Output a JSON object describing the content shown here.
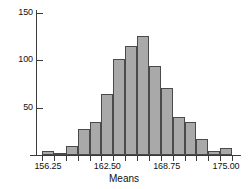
{
  "chart_data": {
    "type": "bar",
    "title": "",
    "subtitle": "",
    "xlabel": "Means",
    "ylabel": "",
    "grid": false,
    "legend": null,
    "bin_width": 1.25,
    "bin_start": 155.625,
    "xlim": [
      155.625,
      175.625
    ],
    "ylim": [
      0,
      160
    ],
    "y_ticks": [
      50,
      100,
      150
    ],
    "y_tick_labels": [
      "50",
      "100",
      "150"
    ],
    "x_ticks": [
      156.25,
      162.5,
      168.75,
      175.0
    ],
    "x_tick_labels": [
      "156.25",
      "162.50",
      "168.75",
      "175.00"
    ],
    "x_minor_tick_count": 17,
    "categories": [
      "155.625-156.875",
      "156.875-158.125",
      "158.125-159.375",
      "159.375-160.625",
      "160.625-161.875",
      "161.875-163.125",
      "163.125-164.375",
      "164.375-165.625",
      "165.625-166.875",
      "166.875-168.125",
      "168.125-169.375",
      "169.375-170.625",
      "170.625-171.875",
      "171.875-173.125",
      "173.125-174.375",
      "174.375-175.625"
    ],
    "bin_centers": [
      156.25,
      157.5,
      158.75,
      160.0,
      161.25,
      162.5,
      163.75,
      165.0,
      166.25,
      167.5,
      168.75,
      170.0,
      171.25,
      172.5,
      173.75,
      175.0
    ],
    "values": [
      4,
      2,
      10,
      27,
      35,
      64,
      101,
      115,
      126,
      94,
      71,
      40,
      35,
      17,
      4,
      7
    ],
    "bar_fill_color": "#a9a9a9",
    "bar_edge_color": "#4a4a4a",
    "axis_color": "#3a3a3a",
    "text_color": "#111111",
    "background_color": "#ffffff"
  }
}
